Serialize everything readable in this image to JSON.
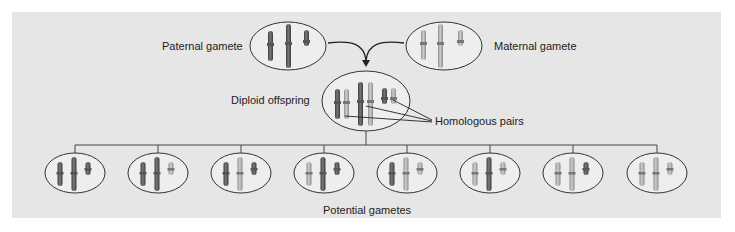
{
  "labels": {
    "paternal": "Paternal gamete",
    "maternal": "Maternal gamete",
    "diploid": "Diploid offspring",
    "homologous": "Homologous pairs",
    "potential": "Potential gametes"
  },
  "colors": {
    "background": "#e6e6e6",
    "paternal_chromosome": "#5a5a5a",
    "maternal_chromosome": "#a8a8a8",
    "outline": "#333333"
  },
  "gametes": [
    [
      "P",
      "P",
      "P"
    ],
    [
      "P",
      "P",
      "M"
    ],
    [
      "P",
      "M",
      "P"
    ],
    [
      "M",
      "P",
      "P"
    ],
    [
      "P",
      "M",
      "M"
    ],
    [
      "M",
      "P",
      "M"
    ],
    [
      "M",
      "M",
      "P"
    ],
    [
      "M",
      "M",
      "M"
    ]
  ]
}
